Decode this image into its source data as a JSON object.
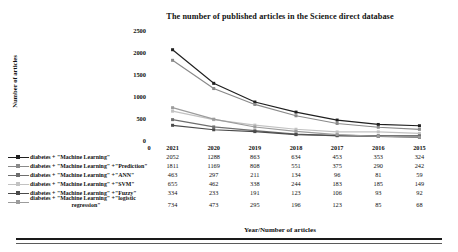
{
  "chart_data": {
    "type": "line",
    "title": "The number of published articles in the Science direct database",
    "xlabel": "Year/Number of articles",
    "ylabel": "Number of articles",
    "categories": [
      "2021",
      "2020",
      "2019",
      "2018",
      "2017",
      "2016",
      "2015"
    ],
    "ylim": [
      0,
      2500
    ],
    "yticks": [
      "0",
      "500",
      "1000",
      "1500",
      "2000",
      "2500"
    ],
    "grid": false,
    "legend_position": "bottom-left-with-table",
    "series": [
      {
        "name": "diabetes + \"Machine Learning\"",
        "color": "#1f1f1f",
        "values": [
          2052,
          1288,
          863,
          634,
          453,
          353,
          324
        ]
      },
      {
        "name": "diabetes + \"Machine Learning\" +\"Prediction\"",
        "color": "#8a8a8a",
        "values": [
          1811,
          1169,
          808,
          551,
          375,
          290,
          242
        ]
      },
      {
        "name": "diabetes + \"Machine Learning\" +\"ANN\"",
        "color": "#6e6e6e",
        "values": [
          463,
          297,
          211,
          134,
          96,
          81,
          59
        ]
      },
      {
        "name": "diabetes + \"Machine Learning\" +\"SVM\"",
        "color": "#c2c2c2",
        "values": [
          655,
          462,
          338,
          244,
          183,
          185,
          149
        ]
      },
      {
        "name": "diabetes + \"Machine Learning\" +\"Fuzzy\"",
        "color": "#4a4a4a",
        "values": [
          334,
          233,
          191,
          123,
          106,
          93,
          92
        ]
      },
      {
        "name": "diabetes + \"Machine Learning\" +\"logistic regression\"",
        "color": "#9c9c9c",
        "values": [
          734,
          473,
          295,
          196,
          123,
          85,
          68
        ]
      }
    ]
  },
  "legend": {
    "items": [
      {
        "label": "diabetes + \"Machine Learning\""
      },
      {
        "label": "diabetes + \"Machine Learning\" +\"Prediction\""
      },
      {
        "label": "diabetes + \"Machine Learning\" +\"ANN\""
      },
      {
        "label": "diabetes + \"Machine Learning\" +\"SVM\""
      },
      {
        "label": "diabetes + \"Machine Learning\" +\"Fuzzy\""
      },
      {
        "label": "diabetes + \"Machine Learning\" +\"logistic",
        "label2": "regression\""
      }
    ]
  },
  "table": {
    "zero_marker": "0",
    "headers": [
      "2021",
      "2020",
      "2019",
      "2018",
      "2017",
      "2016",
      "2015"
    ],
    "rows": [
      [
        "2052",
        "1288",
        "863",
        "634",
        "453",
        "353",
        "324"
      ],
      [
        "1811",
        "1169",
        "808",
        "551",
        "375",
        "290",
        "242"
      ],
      [
        "463",
        "297",
        "211",
        "134",
        "96",
        "81",
        "59"
      ],
      [
        "655",
        "462",
        "338",
        "244",
        "183",
        "185",
        "149"
      ],
      [
        "334",
        "233",
        "191",
        "123",
        "106",
        "93",
        "92"
      ],
      [
        "734",
        "473",
        "295",
        "196",
        "123",
        "85",
        "68"
      ]
    ]
  }
}
